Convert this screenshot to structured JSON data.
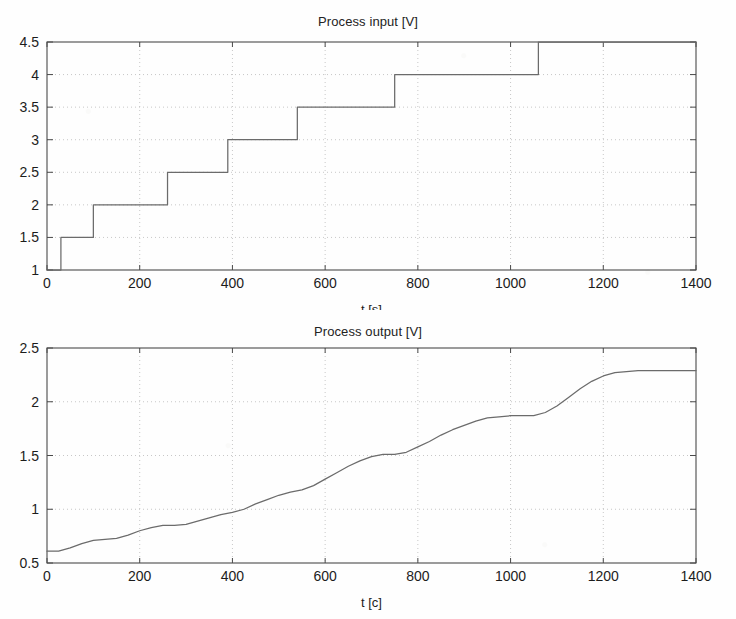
{
  "page": {
    "background_color": "#fefefe",
    "line_color": "#6b6b6b",
    "axis_color": "#4a4a4a",
    "grid_color": "#b9b9b9",
    "text_color": "#1c1c1c"
  },
  "figures": [
    {
      "id": "process-input",
      "title": "Process input [V]",
      "xlabel": "t [s]",
      "yticklabels": [
        "1",
        "1.5",
        "2",
        "2.5",
        "3",
        "3.5",
        "4",
        "4.5"
      ],
      "xticklabels": [
        "0",
        "200",
        "400",
        "600",
        "800",
        "1000",
        "1200",
        "1400"
      ]
    },
    {
      "id": "process-output",
      "title": "Process output [V]",
      "xlabel": "t [c]",
      "yticklabels": [
        "0.5",
        "1",
        "1.5",
        "2",
        "2.5"
      ],
      "xticklabels": [
        "0",
        "200",
        "400",
        "600",
        "800",
        "1000",
        "1200",
        "1400"
      ]
    }
  ],
  "chart_data": [
    {
      "type": "line",
      "id": "process-input",
      "title": "Process input [V]",
      "xlabel": "t [s]",
      "ylabel": "",
      "xlim": [
        0,
        1400
      ],
      "ylim": [
        1,
        4.5
      ],
      "xticks": [
        0,
        200,
        400,
        600,
        800,
        1000,
        1200,
        1400
      ],
      "yticks": [
        1,
        1.5,
        2,
        2.5,
        3,
        3.5,
        4,
        4.5
      ],
      "grid": true,
      "legend": null,
      "drawstyle": "steps-post",
      "step_times": [
        0,
        30,
        100,
        260,
        390,
        540,
        750,
        1060,
        1400
      ],
      "step_values": [
        1.0,
        1.5,
        2.0,
        2.5,
        3.0,
        3.5,
        4.0,
        4.5,
        4.5
      ],
      "x": [
        0,
        30,
        30,
        100,
        100,
        260,
        260,
        390,
        390,
        540,
        540,
        750,
        750,
        1060,
        1060,
        1400
      ],
      "y": [
        1.0,
        1.0,
        1.5,
        1.5,
        2.0,
        2.0,
        2.5,
        2.5,
        3.0,
        3.0,
        3.5,
        3.5,
        4.0,
        4.0,
        4.5,
        4.5
      ]
    },
    {
      "type": "line",
      "id": "process-output",
      "title": "Process output [V]",
      "xlabel": "t [c]",
      "ylabel": "",
      "xlim": [
        0,
        1400
      ],
      "ylim": [
        0.5,
        2.5
      ],
      "xticks": [
        0,
        200,
        400,
        600,
        800,
        1000,
        1200,
        1400
      ],
      "yticks": [
        0.5,
        1,
        1.5,
        2,
        2.5
      ],
      "grid": true,
      "legend": null,
      "drawstyle": "default",
      "x": [
        0,
        25,
        50,
        75,
        100,
        125,
        150,
        175,
        200,
        225,
        250,
        275,
        300,
        325,
        350,
        375,
        400,
        425,
        450,
        475,
        500,
        525,
        550,
        575,
        600,
        625,
        650,
        675,
        700,
        725,
        750,
        775,
        800,
        825,
        850,
        875,
        900,
        925,
        950,
        975,
        1000,
        1025,
        1050,
        1075,
        1100,
        1125,
        1150,
        1175,
        1200,
        1225,
        1250,
        1275,
        1300,
        1325,
        1350,
        1375,
        1400
      ],
      "y": [
        0.61,
        0.61,
        0.64,
        0.68,
        0.71,
        0.72,
        0.73,
        0.76,
        0.8,
        0.83,
        0.85,
        0.85,
        0.86,
        0.89,
        0.92,
        0.95,
        0.97,
        1.0,
        1.05,
        1.09,
        1.13,
        1.16,
        1.18,
        1.22,
        1.28,
        1.34,
        1.4,
        1.45,
        1.49,
        1.51,
        1.51,
        1.53,
        1.58,
        1.63,
        1.69,
        1.74,
        1.78,
        1.82,
        1.85,
        1.86,
        1.87,
        1.87,
        1.87,
        1.9,
        1.96,
        2.04,
        2.12,
        2.19,
        2.24,
        2.27,
        2.28,
        2.29,
        2.29,
        2.29,
        2.29,
        2.29,
        2.29
      ]
    }
  ]
}
